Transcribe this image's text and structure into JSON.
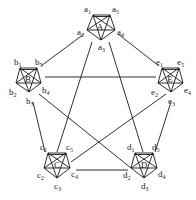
{
  "diagram": {
    "title": "",
    "clusters": [
      {
        "id": "A",
        "center_label": "A",
        "center": [
          100,
          27
        ],
        "nodes": [
          {
            "id": "a1",
            "letter": "a",
            "sub": "1",
            "pos": [
              93,
              15
            ],
            "label_pos": [
              84,
              12
            ]
          },
          {
            "id": "a5",
            "letter": "a",
            "sub": "5",
            "pos": [
              110,
              15
            ],
            "label_pos": [
              112,
              12
            ]
          },
          {
            "id": "a4",
            "letter": "a",
            "sub": "4",
            "pos": [
              115,
              30
            ],
            "label_pos": [
              117,
              35
            ]
          },
          {
            "id": "a3",
            "letter": "a",
            "sub": "3",
            "pos": [
              101,
              40
            ],
            "label_pos": [
              98,
              50
            ]
          },
          {
            "id": "a2",
            "letter": "a",
            "sub": "2",
            "pos": [
              87,
              30
            ],
            "label_pos": [
              77,
              35
            ]
          }
        ]
      },
      {
        "id": "B",
        "center_label": "B",
        "center": [
          28,
          79
        ],
        "nodes": [
          {
            "id": "b1",
            "letter": "b",
            "sub": "1",
            "pos": [
              20,
              68
            ],
            "label_pos": [
              14,
              65
            ]
          },
          {
            "id": "b5",
            "letter": "b",
            "sub": "5",
            "pos": [
              37,
              68
            ],
            "label_pos": [
              35,
              65
            ]
          },
          {
            "id": "b4",
            "letter": "b",
            "sub": "4",
            "pos": [
              41,
              83
            ],
            "label_pos": [
              42,
              93
            ]
          },
          {
            "id": "b3",
            "letter": "b",
            "sub": "3",
            "pos": [
              29,
              92
            ],
            "label_pos": [
              26,
              104
            ]
          },
          {
            "id": "b2",
            "letter": "b",
            "sub": "2",
            "pos": [
              16,
              83
            ],
            "label_pos": [
              9,
              95
            ]
          }
        ]
      },
      {
        "id": "E",
        "center_label": "E",
        "center": [
          170,
          79
        ],
        "nodes": [
          {
            "id": "e1",
            "letter": "e",
            "sub": "1",
            "pos": [
              162,
              68
            ],
            "label_pos": [
              156,
              65
            ]
          },
          {
            "id": "e5",
            "letter": "e",
            "sub": "5",
            "pos": [
              179,
              68
            ],
            "label_pos": [
              177,
              65
            ]
          },
          {
            "id": "e4",
            "letter": "e",
            "sub": "4",
            "pos": [
              183,
              83
            ],
            "label_pos": [
              184,
              93
            ]
          },
          {
            "id": "e3",
            "letter": "e",
            "sub": "3",
            "pos": [
              171,
              92
            ],
            "label_pos": [
              168,
              104
            ]
          },
          {
            "id": "e2",
            "letter": "e",
            "sub": "2",
            "pos": [
              158,
              83
            ],
            "label_pos": [
              151,
              95
            ]
          }
        ]
      },
      {
        "id": "C",
        "center_label": "C",
        "center": [
          57,
          165
        ],
        "nodes": [
          {
            "id": "c1",
            "letter": "c",
            "sub": "1",
            "pos": [
              48,
              153
            ],
            "label_pos": [
              40,
              150
            ]
          },
          {
            "id": "c5",
            "letter": "c",
            "sub": "5",
            "pos": [
              66,
              153
            ],
            "label_pos": [
              66,
              150
            ]
          },
          {
            "id": "c4",
            "letter": "c",
            "sub": "4",
            "pos": [
              70,
              168
            ],
            "label_pos": [
              71,
              177
            ]
          },
          {
            "id": "c3",
            "letter": "c",
            "sub": "3",
            "pos": [
              57,
              178
            ],
            "label_pos": [
              54,
              189
            ]
          },
          {
            "id": "c2",
            "letter": "c",
            "sub": "2",
            "pos": [
              44,
              168
            ],
            "label_pos": [
              37,
              178
            ]
          }
        ]
      },
      {
        "id": "D",
        "center_label": "D",
        "center": [
          144,
          165
        ],
        "nodes": [
          {
            "id": "d1",
            "letter": "d",
            "sub": "1",
            "pos": [
              135,
              153
            ],
            "label_pos": [
              127,
              150
            ]
          },
          {
            "id": "d5",
            "letter": "d",
            "sub": "5",
            "pos": [
              153,
              153
            ],
            "label_pos": [
              152,
              150
            ]
          },
          {
            "id": "d4",
            "letter": "d",
            "sub": "4",
            "pos": [
              157,
              168
            ],
            "label_pos": [
              158,
              177
            ]
          },
          {
            "id": "d3",
            "letter": "d",
            "sub": "3",
            "pos": [
              144,
              178
            ],
            "label_pos": [
              141,
              189
            ]
          },
          {
            "id": "d2",
            "letter": "d",
            "sub": "2",
            "pos": [
              131,
              168
            ],
            "label_pos": [
              123,
              178
            ]
          }
        ]
      }
    ],
    "inter_cluster_edges": [
      {
        "from": "a2",
        "to": "b5",
        "p1": [
          84,
          34
        ],
        "p2": [
          41,
          66
        ]
      },
      {
        "from": "a4",
        "to": "e1",
        "p1": [
          118,
          34
        ],
        "p2": [
          159,
          66
        ]
      },
      {
        "from": "a3",
        "to": "c1",
        "p1": [
          92,
          42
        ],
        "p2": [
          57,
          152
        ]
      },
      {
        "from": "a3",
        "to": "d1",
        "p1": [
          109,
          42
        ],
        "p2": [
          143,
          152
        ]
      },
      {
        "from": "b4",
        "to": "e2",
        "p1": [
          45,
          77
        ],
        "p2": [
          156,
          77
        ]
      },
      {
        "from": "b3",
        "to": "c1",
        "p1": [
          33,
          102
        ],
        "p2": [
          45,
          152
        ]
      },
      {
        "from": "b4",
        "to": "d2",
        "p1": [
          39,
          94
        ],
        "p2": [
          131,
          168
        ]
      },
      {
        "from": "e3",
        "to": "c4",
        "p1": [
          166,
          94
        ],
        "p2": [
          71,
          162
        ]
      },
      {
        "from": "e3",
        "to": "d5",
        "p1": [
          171,
          102
        ],
        "p2": [
          155,
          152
        ]
      },
      {
        "from": "c4",
        "to": "d2",
        "p1": [
          76,
          170
        ],
        "p2": [
          128,
          170
        ]
      }
    ],
    "colors": {
      "stroke": "#1a1a1a",
      "background": "#ffffff"
    }
  }
}
